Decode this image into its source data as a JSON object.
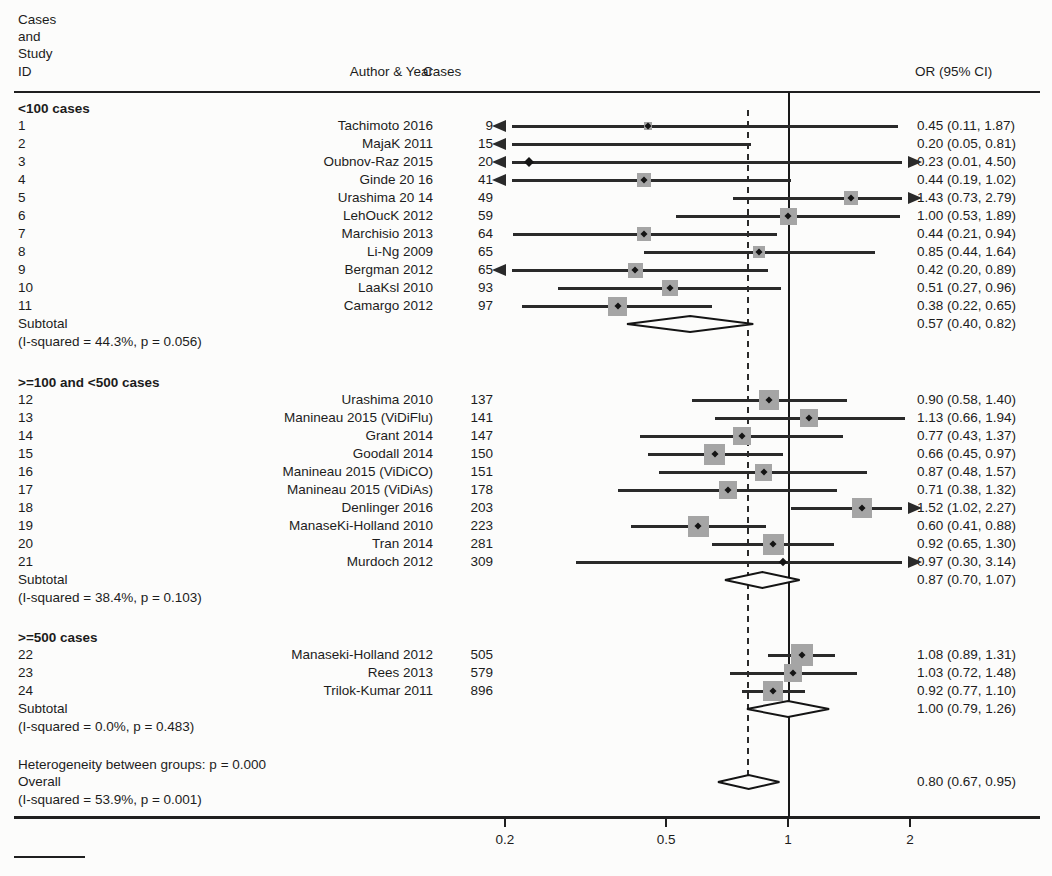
{
  "header": {
    "left_lines": [
      "Cases",
      "and",
      "Study",
      "ID"
    ],
    "author_col": "Author & Year",
    "cases_col": "Cases",
    "or_col": "OR (95% CI)"
  },
  "chart_data": {
    "type": "forest",
    "scale": "log",
    "axis": {
      "ticks": [
        0.2,
        0.5,
        1,
        2
      ],
      "tick_labels": [
        "0.2",
        "0.5",
        "1",
        "2"
      ],
      "reference_line": 1,
      "dashed_line_at": 0.8,
      "display_range": [
        0.2,
        2
      ]
    },
    "groups": [
      {
        "label": "<100 cases",
        "studies": [
          {
            "id": "1",
            "author": "Tachimoto 2016",
            "cases": "9",
            "or": 0.45,
            "lo": 0.11,
            "hi": 1.87,
            "display": "0.45 (0.11, 1.87)",
            "w": 8,
            "al": true,
            "ar": false
          },
          {
            "id": "2",
            "author": "MajaK 2011",
            "cases": "15",
            "or": 0.2,
            "lo": 0.05,
            "hi": 0.81,
            "display": "0.20 (0.05, 0.81)",
            "w": 0,
            "al": true,
            "ar": false
          },
          {
            "id": "3",
            "author": "Oubnov-Raz 2015",
            "cases": "20",
            "or": 0.23,
            "lo": 0.01,
            "hi": 4.5,
            "display": "0.23 (0.01, 4.50)",
            "w": 6,
            "al": true,
            "ar": true
          },
          {
            "id": "4",
            "author": "Ginde 20 16",
            "cases": "41",
            "or": 0.44,
            "lo": 0.19,
            "hi": 1.02,
            "display": "0.44 (0.19, 1.02)",
            "w": 14,
            "al": true,
            "ar": false
          },
          {
            "id": "5",
            "author": "Urashima 20 14",
            "cases": "49",
            "or": 1.43,
            "lo": 0.73,
            "hi": 2.79,
            "display": "1.43 (0.73, 2.79)",
            "w": 14,
            "al": false,
            "ar": true
          },
          {
            "id": "6",
            "author": "LehOucK 2012",
            "cases": "59",
            "or": 1.0,
            "lo": 0.53,
            "hi": 1.89,
            "display": "1.00 (0.53, 1.89)",
            "w": 17,
            "al": false,
            "ar": false
          },
          {
            "id": "7",
            "author": "Marchisio 2013",
            "cases": "64",
            "or": 0.44,
            "lo": 0.21,
            "hi": 0.94,
            "display": "0.44 (0.21, 0.94)",
            "w": 14,
            "al": false,
            "ar": false
          },
          {
            "id": "8",
            "author": "Li-Ng 2009",
            "cases": "65",
            "or": 0.85,
            "lo": 0.44,
            "hi": 1.64,
            "display": "0.85 (0.44, 1.64)",
            "w": 12,
            "al": false,
            "ar": false
          },
          {
            "id": "9",
            "author": "Bergman 2012",
            "cases": "65",
            "or": 0.42,
            "lo": 0.2,
            "hi": 0.89,
            "display": "0.42 (0.20, 0.89)",
            "w": 15,
            "al": true,
            "ar": false
          },
          {
            "id": "10",
            "author": "LaaKsl 2010",
            "cases": "93",
            "or": 0.51,
            "lo": 0.27,
            "hi": 0.96,
            "display": "0.51 (0.27, 0.96)",
            "w": 16,
            "al": false,
            "ar": false
          },
          {
            "id": "11",
            "author": "Camargo 2012",
            "cases": "97",
            "or": 0.38,
            "lo": 0.22,
            "hi": 0.65,
            "display": "0.38 (0.22, 0.65)",
            "w": 19,
            "al": false,
            "ar": false
          }
        ],
        "subtotal": {
          "label": "Subtotal",
          "het": "(I-squared = 44.3%, p = 0.056)",
          "or": 0.57,
          "lo": 0.4,
          "hi": 0.82,
          "display": "0.57 (0.40, 0.82)"
        }
      },
      {
        "label": ">=100 and <500 cases",
        "studies": [
          {
            "id": "12",
            "author": "Urashima 2010",
            "cases": "137",
            "or": 0.9,
            "lo": 0.58,
            "hi": 1.4,
            "display": "0.90 (0.58, 1.40)",
            "w": 20,
            "al": false,
            "ar": false
          },
          {
            "id": "13",
            "author": "Manineau 2015 (ViDiFlu)",
            "cases": "141",
            "or": 1.13,
            "lo": 0.66,
            "hi": 1.94,
            "display": "1.13 (0.66, 1.94)",
            "w": 18,
            "al": false,
            "ar": false
          },
          {
            "id": "14",
            "author": "Grant 2014",
            "cases": "147",
            "or": 0.77,
            "lo": 0.43,
            "hi": 1.37,
            "display": "0.77 (0.43, 1.37)",
            "w": 18,
            "al": false,
            "ar": false
          },
          {
            "id": "15",
            "author": "Goodall 2014",
            "cases": "150",
            "or": 0.66,
            "lo": 0.45,
            "hi": 0.97,
            "display": "0.66 (0.45, 0.97)",
            "w": 21,
            "al": false,
            "ar": false
          },
          {
            "id": "16",
            "author": "Manineau 2015 (ViDiCO)",
            "cases": "151",
            "or": 0.87,
            "lo": 0.48,
            "hi": 1.57,
            "display": "0.87 (0.48, 1.57)",
            "w": 17,
            "al": false,
            "ar": false
          },
          {
            "id": "17",
            "author": "Manineau 2015 (ViDiAs)",
            "cases": "178",
            "or": 0.71,
            "lo": 0.38,
            "hi": 1.32,
            "display": "0.71 (0.38, 1.32)",
            "w": 18,
            "al": false,
            "ar": false
          },
          {
            "id": "18",
            "author": "Denlinger 2016",
            "cases": "203",
            "or": 1.52,
            "lo": 1.02,
            "hi": 2.27,
            "display": "1.52 (1.02, 2.27)",
            "w": 20,
            "al": false,
            "ar": true
          },
          {
            "id": "19",
            "author": "ManaseKi-Holland 2010",
            "cases": "223",
            "or": 0.6,
            "lo": 0.41,
            "hi": 0.88,
            "display": "0.60 (0.41, 0.88)",
            "w": 21,
            "al": false,
            "ar": false
          },
          {
            "id": "20",
            "author": "Tran 2014",
            "cases": "281",
            "or": 0.92,
            "lo": 0.65,
            "hi": 1.3,
            "display": "0.92 (0.65, 1.30)",
            "w": 21,
            "al": false,
            "ar": false
          },
          {
            "id": "21",
            "author": "Murdoch 2012",
            "cases": "309",
            "or": 0.97,
            "lo": 0.3,
            "hi": 3.14,
            "display": "0.97 (0.30, 3.14)",
            "w": 5,
            "al": false,
            "ar": true
          }
        ],
        "subtotal": {
          "label": "Subtotal",
          "het": "(I-squared = 38.4%, p = 0.103)",
          "or": 0.87,
          "lo": 0.7,
          "hi": 1.07,
          "display": "0.87 (0.70, 1.07)"
        }
      },
      {
        "label": ">=500 cases",
        "studies": [
          {
            "id": "22",
            "author": "Manaseki-Holland 2012",
            "cases": "505",
            "or": 1.08,
            "lo": 0.89,
            "hi": 1.31,
            "display": "1.08 (0.89, 1.31)",
            "w": 22,
            "al": false,
            "ar": false
          },
          {
            "id": "23",
            "author": "Rees 2013",
            "cases": "579",
            "or": 1.03,
            "lo": 0.72,
            "hi": 1.48,
            "display": "1.03 (0.72, 1.48)",
            "w": 18,
            "al": false,
            "ar": false
          },
          {
            "id": "24",
            "author": "Trilok-Kumar 2011",
            "cases": "896",
            "or": 0.92,
            "lo": 0.77,
            "hi": 1.1,
            "display": "0.92 (0.77, 1.10)",
            "w": 20,
            "al": false,
            "ar": false
          }
        ],
        "subtotal": {
          "label": "Subtotal",
          "het": "(I-squared = 0.0%, p = 0.483)",
          "or": 1.0,
          "lo": 0.79,
          "hi": 1.26,
          "display": "1.00 (0.79, 1.26)"
        }
      }
    ],
    "heterogeneity_note": "Heterogeneity between groups: p = 0.000",
    "overall": {
      "label": "Overall",
      "het": "(I-squared = 53.9%, p = 0.001)",
      "or": 0.8,
      "lo": 0.67,
      "hi": 0.95,
      "display": "0.80 (0.67, 0.95)"
    }
  }
}
